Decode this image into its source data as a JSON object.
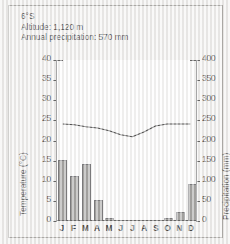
{
  "header": {
    "latitude": "6°S",
    "altitude": "Altitude: 1,120 m",
    "precipitation": "Annual precipitation: 570  mm"
  },
  "axes": {
    "left_title": "Temperature (°C)",
    "right_title": "Precipitation (mm)",
    "left_ticks": [
      "40",
      "35",
      "30",
      "25",
      "20",
      "15",
      "10",
      "5",
      "0"
    ],
    "right_ticks": [
      "400",
      "350",
      "300",
      "250",
      "200",
      "150",
      "100",
      "50",
      "0"
    ]
  },
  "chart_data": {
    "type": "bar",
    "title": "",
    "subtitle": "6°S  Altitude: 1,120 m  Annual precipitation: 570 mm",
    "categories": [
      "J",
      "F",
      "M",
      "A",
      "M",
      "J",
      "J",
      "A",
      "S",
      "O",
      "N",
      "D"
    ],
    "month_labels": [
      "J",
      "F",
      "M",
      "A",
      "M",
      "J",
      "J",
      "A",
      "S",
      "O",
      "N",
      "D"
    ],
    "xlabel": "",
    "ylabel": "Temperature (°C)",
    "y2label": "Precipitation (mm)",
    "ylim": [
      0,
      40
    ],
    "y2lim": [
      0,
      400
    ],
    "ytick_step": 5,
    "y2tick_step": 50,
    "grid": false,
    "legend": "none",
    "series": [
      {
        "name": "Precipitation",
        "type": "bar",
        "axis": "right",
        "unit": "mm",
        "color": "#8e8d8b",
        "edge_color": "#56565a",
        "values": [
          150,
          110,
          140,
          50,
          5,
          0,
          0,
          0,
          0,
          5,
          20,
          90
        ]
      },
      {
        "name": "Temperature",
        "type": "line",
        "axis": "left",
        "unit": "°C",
        "color": "#1a1a1a",
        "values": [
          24,
          23.8,
          23.3,
          23,
          22.3,
          21.3,
          20.8,
          22,
          23.5,
          24,
          24,
          24
        ]
      }
    ],
    "annual_precipitation_mm": 570,
    "latitude": "6°S",
    "altitude_m": 1120
  },
  "colors": {
    "bar_fill": "#8e8d8b",
    "bar_edge": "#56565a",
    "line": "#1a1a1a",
    "axis": "#3a3a3a",
    "frame": "#9a9894",
    "page_bg": "#f0efee",
    "plot_bg": "#fdfdfd",
    "text": "#1b1b1b"
  }
}
